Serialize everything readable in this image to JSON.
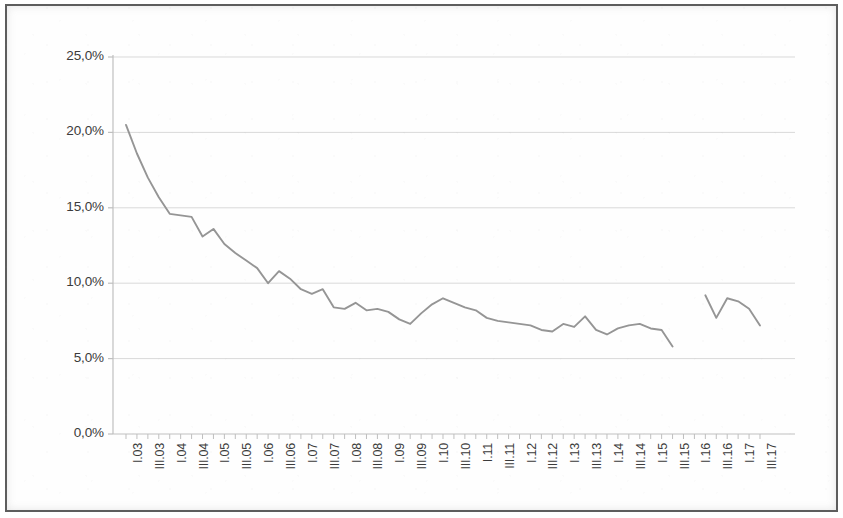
{
  "figure": {
    "background_color": "#ffffff",
    "frame_color": "#5d5d5d",
    "line_color": "#959595",
    "grid_color": "#d9d9d9",
    "axis_color": "#bfbfbf",
    "tick_label_color": "#3b3b3b"
  },
  "chart_data": {
    "type": "line",
    "title": "",
    "subtitle": "",
    "xlabel": "",
    "ylabel": "",
    "legend": [],
    "legend_position": "none",
    "grid": true,
    "grid_axis": "y",
    "ylim": [
      0,
      25
    ],
    "ytick_labels": [
      "0,0%",
      "5,0%",
      "10,0%",
      "15,0%",
      "20,0%",
      "25,0%"
    ],
    "ytick_values": [
      0,
      5,
      10,
      15,
      20,
      25
    ],
    "y_unit": "%",
    "decimal_separator": ",",
    "x_tick_interval": "every second quarter labelled",
    "categories": [
      "I.03",
      "II.03",
      "III.03",
      "IV.03",
      "I.04",
      "II.04",
      "III.04",
      "IV.04",
      "I.05",
      "II.05",
      "III.05",
      "IV.05",
      "I.06",
      "II.06",
      "III.06",
      "IV.06",
      "I.07",
      "II.07",
      "III.07",
      "IV.07",
      "I.08",
      "II.08",
      "III.08",
      "IV.08",
      "I.09",
      "II.09",
      "III.09",
      "IV.09",
      "I.10",
      "II.10",
      "III.10",
      "IV.10",
      "I.11",
      "II.11",
      "III.11",
      "IV.11",
      "I.12",
      "II.12",
      "III.12",
      "IV.12",
      "I.13",
      "II.13",
      "III.13",
      "IV.13",
      "I.14",
      "II.14",
      "III.14",
      "IV.14",
      "I.15",
      "II.15",
      "III.15",
      "IV.15",
      "I.16",
      "II.16",
      "III.16",
      "IV.16",
      "I.17",
      "II.17",
      "III.17"
    ],
    "xtick_labels": [
      "I.03",
      "III.03",
      "I.04",
      "III.04",
      "I.05",
      "III.05",
      "I.06",
      "III.06",
      "I.07",
      "III.07",
      "I.08",
      "III.08",
      "I.09",
      "III.09",
      "I.10",
      "III.10",
      "I.11",
      "III.11",
      "I.12",
      "III.12",
      "I.13",
      "III.13",
      "I.14",
      "III.14",
      "I.15",
      "III.15",
      "I.16",
      "III.16",
      "I.17",
      "III.17"
    ],
    "series": [
      {
        "name": "",
        "has_gap": true,
        "gap_after_category": "III.15",
        "gap_resumes_at_category": "II.16",
        "values": [
          20.5,
          18.6,
          17.0,
          15.7,
          14.6,
          14.5,
          14.4,
          13.1,
          13.6,
          12.6,
          12.0,
          11.5,
          11.0,
          10.0,
          10.8,
          10.3,
          9.6,
          9.3,
          9.6,
          8.4,
          8.3,
          8.7,
          8.2,
          8.3,
          8.1,
          7.6,
          7.3,
          8.0,
          8.6,
          9.0,
          8.7,
          8.4,
          8.2,
          7.7,
          7.5,
          7.4,
          7.3,
          7.2,
          6.9,
          6.8,
          7.3,
          7.1,
          7.8,
          6.9,
          6.6,
          7.0,
          7.2,
          7.3,
          7.0,
          6.9,
          5.8,
          null,
          null,
          9.2,
          7.7,
          9.0,
          8.8,
          8.3,
          7.2
        ]
      }
    ]
  }
}
